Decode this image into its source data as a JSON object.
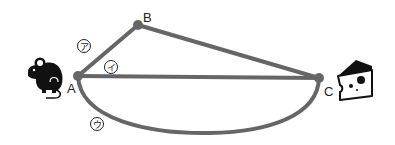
{
  "diagram": {
    "points": {
      "A": {
        "label": "A",
        "x": 78,
        "y": 76
      },
      "B": {
        "label": "B",
        "x": 138,
        "y": 25
      },
      "C": {
        "label": "C",
        "x": 319,
        "y": 78
      }
    },
    "paths": [
      {
        "id": "a",
        "label": "ア",
        "description": "A → B → C"
      },
      {
        "id": "i",
        "label": "イ",
        "description": "A → C straight"
      },
      {
        "id": "u",
        "label": "ウ",
        "description": "A → C curved arc"
      }
    ],
    "icons": {
      "start": "mouse-icon",
      "goal": "cheese-icon"
    },
    "colors": {
      "line": "#666666",
      "icon": "#111111",
      "background": "#ffffff"
    }
  }
}
